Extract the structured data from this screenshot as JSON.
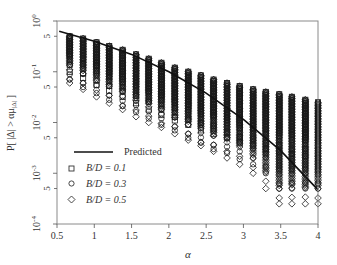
{
  "chart_data": {
    "type": "scatter",
    "title": "",
    "xlabel": "α",
    "ylabel": "P[ |Δ| > αμ|Δ| ]",
    "xscale": "linear",
    "yscale": "log",
    "xlim": [
      0.5,
      4
    ],
    "ylim": [
      0.0001,
      1
    ],
    "xticks": [
      0.5,
      1,
      1.5,
      2,
      2.5,
      3,
      3.5,
      4
    ],
    "xtick_labels": [
      "0.5",
      "1",
      "1.5",
      "2",
      "2.5",
      "3",
      "3.5",
      "4"
    ],
    "yticks_major": [
      0.0001,
      0.001,
      0.01,
      0.1,
      1
    ],
    "ytick_labels_major": [
      "10^-4",
      "10^-3",
      "10^-2",
      "10^-1",
      "10^0"
    ],
    "yticks_minor_labeled": [
      0.0005,
      0.005,
      0.05,
      0.5
    ],
    "ytick_labels_minor": [
      "5",
      "5",
      "5",
      "5"
    ],
    "grid": false,
    "legend": {
      "position": "lower left",
      "entries": [
        {
          "label": "Predicted",
          "marker": "line"
        },
        {
          "label": "B/D = 0.1",
          "marker": "square"
        },
        {
          "label": "B/D = 0.3",
          "marker": "circle"
        },
        {
          "label": "B/D = 0.5",
          "marker": "diamond"
        }
      ]
    },
    "predicted": {
      "name": "Predicted",
      "x": [
        0.53,
        1.0,
        1.5,
        2.0,
        2.5,
        3.0,
        3.5,
        4.0
      ],
      "y": [
        0.63,
        0.4,
        0.22,
        0.1,
        0.038,
        0.0115,
        0.0028,
        0.00047
      ]
    },
    "columns": {
      "alpha": [
        0.67,
        0.85,
        1.03,
        1.2,
        1.38,
        1.56,
        1.73,
        1.9,
        2.08,
        2.26,
        2.43,
        2.6,
        2.78,
        2.95,
        3.13,
        3.3,
        3.48,
        3.65,
        3.83,
        4.0
      ],
      "series": [
        {
          "name": "B/D = 0.1",
          "marker": "square",
          "top": [
            0.5,
            0.45,
            0.38,
            0.32,
            0.27,
            0.22,
            0.18,
            0.15,
            0.12,
            0.1,
            0.085,
            0.07,
            0.06,
            0.052,
            0.045,
            0.04,
            0.036,
            0.032,
            0.028,
            0.025
          ],
          "bottom": [
            0.1,
            0.075,
            0.055,
            0.042,
            0.032,
            0.024,
            0.018,
            0.014,
            0.011,
            0.009,
            0.007,
            0.006,
            0.005,
            0.004,
            0.0035,
            0.003,
            0.0027,
            0.0024,
            0.0022,
            0.002
          ]
        },
        {
          "name": "B/D = 0.3",
          "marker": "circle",
          "top": [
            0.5,
            0.45,
            0.38,
            0.32,
            0.27,
            0.22,
            0.18,
            0.15,
            0.12,
            0.1,
            0.085,
            0.07,
            0.06,
            0.052,
            0.045,
            0.04,
            0.036,
            0.032,
            0.028,
            0.025
          ],
          "bottom": [
            0.07,
            0.05,
            0.038,
            0.028,
            0.021,
            0.016,
            0.012,
            0.009,
            0.007,
            0.005,
            0.004,
            0.003,
            0.0025,
            0.0019,
            0.0015,
            0.001,
            0.0005,
            0.0005,
            0.0005,
            0.0005
          ]
        },
        {
          "name": "B/D = 0.5",
          "marker": "diamond",
          "top": [
            0.5,
            0.45,
            0.38,
            0.32,
            0.27,
            0.22,
            0.18,
            0.15,
            0.12,
            0.1,
            0.085,
            0.07,
            0.06,
            0.052,
            0.045,
            0.04,
            0.036,
            0.032,
            0.028,
            0.025
          ],
          "bottom": [
            0.06,
            0.045,
            0.032,
            0.024,
            0.018,
            0.013,
            0.01,
            0.008,
            0.006,
            0.0045,
            0.0035,
            0.0027,
            0.002,
            0.0015,
            0.001,
            0.0005,
            0.00025,
            0.00025,
            0.00025,
            0.00025
          ]
        }
      ]
    }
  },
  "labels": {
    "xlabel": "α",
    "ylabel_main": "P[ |Δ| > αμ",
    "ylabel_sub": "|Δ|",
    "ylabel_end": " ]",
    "legend_predicted": "Predicted",
    "legend_bd01": "B/D = 0.1",
    "legend_bd03": "B/D = 0.3",
    "legend_bd05": "B/D = 0.5"
  },
  "colors": {
    "frame": "#8a8a8a",
    "marker": "#1a1a1a",
    "line": "#111111"
  }
}
